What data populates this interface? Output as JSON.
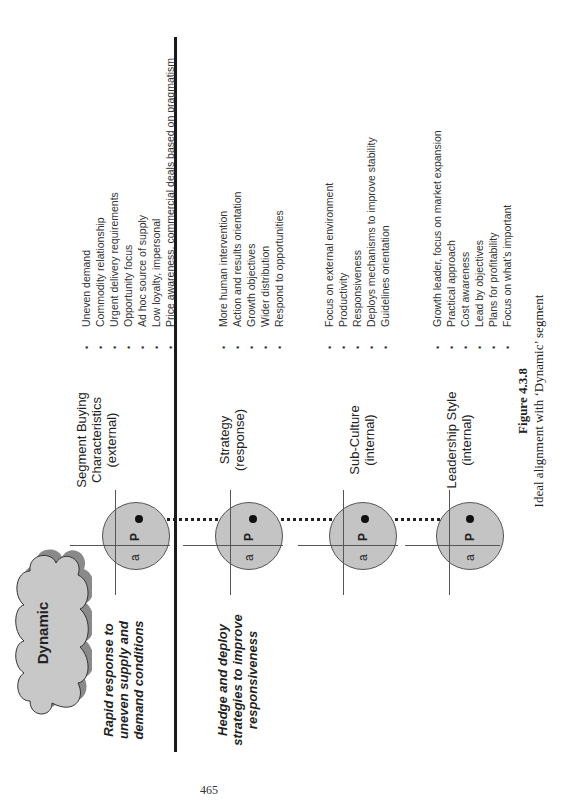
{
  "figure": {
    "cloud_label": "Dynamic",
    "rows": [
      {
        "left_label_lines": [
          "Rapid response to",
          "uneven supply and",
          "demand conditions"
        ],
        "heading_lines": [
          "Segment Buying",
          "Characteristics",
          "(external)"
        ],
        "axis_labels": {
          "a": "a",
          "p": "P"
        },
        "bullets": [
          "Uneven demand",
          "Commodity relationship",
          "Urgent delivery requirements",
          "Opportunity focus",
          "Ad hoc source of supply",
          "Low loyalty, impersonal",
          "Price awareness, commercial deals based on pragmatism"
        ]
      },
      {
        "left_label_lines": [
          "Hedge and deploy",
          "strategies to improve",
          "responsiveness"
        ],
        "heading_lines": [
          "Strategy",
          "(response)"
        ],
        "axis_labels": {
          "a": "a",
          "p": "P"
        },
        "bullets": [
          "More human intervention",
          "Action and results orientation",
          "Growth objectives",
          "Wider distribution",
          "Respond to opportunities"
        ]
      },
      {
        "left_label_lines": [],
        "heading_lines": [
          "Sub-Culture",
          "(internal)"
        ],
        "axis_labels": {
          "a": "a",
          "p": "P"
        },
        "bullets": [
          "Focus on external environment",
          "Productivity",
          "Responsiveness",
          "Deploys mechanisms to improve stability",
          "Guidelines orientation"
        ]
      },
      {
        "left_label_lines": [],
        "heading_lines": [
          "Leadership Style",
          "(internal)"
        ],
        "axis_labels": {
          "a": "a",
          "p": "P"
        },
        "bullets": [
          "Growth leader, focus on market expansion",
          "Practical approach",
          "Cost awareness",
          "Lead by objectives",
          "Plans for profitability",
          "Focus on what's important"
        ]
      }
    ],
    "bullet_glyph": "•",
    "caption_title": "Figure 4.3.8",
    "caption_text": "Ideal alignment with ‘Dynamic’ segment"
  },
  "page_number": "465",
  "colors": {
    "circle_fill": "#c4c4c4",
    "cloud_fill": "#c8c8c8",
    "cloud_shadow": "#8a8a8a",
    "rule": "#1a1a1a"
  }
}
